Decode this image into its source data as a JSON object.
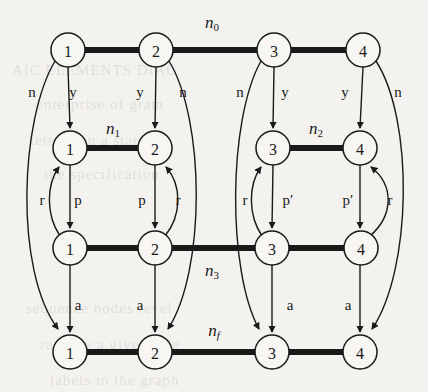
{
  "figure": {
    "background_color": "#f3f2ef",
    "ink_color": "#1a1a1a",
    "node_radius": 17,
    "thick_edge_width": 6,
    "thin_edge_width": 1.4
  },
  "ghost_text": [
    {
      "text": "AIC    ELEMENTS    DIAG",
      "x": 12,
      "y": 62
    },
    {
      "text": "enterprise  of  gram",
      "x": 36,
      "y": 96
    },
    {
      "text": "tetrated  n  a  state",
      "x": 30,
      "y": 132
    },
    {
      "text": "the  specification",
      "x": 44,
      "y": 166
    },
    {
      "text": "sequence  nodes  level",
      "x": 26,
      "y": 300
    },
    {
      "text": "rank  by  a  given  role",
      "x": 40,
      "y": 336
    },
    {
      "text": "labels  in  the  graph",
      "x": 50,
      "y": 372
    }
  ],
  "rows": [
    {
      "id": "row0",
      "name_label": "n_0",
      "name_base": "n",
      "name_sub": "0",
      "name_sub_italic": false,
      "label_x": 212,
      "label_y": 22,
      "y": 50,
      "nodes": [
        {
          "label": "1",
          "x": 68
        },
        {
          "label": "2",
          "x": 156
        },
        {
          "label": "3",
          "x": 274
        },
        {
          "label": "4",
          "x": 363
        }
      ]
    },
    {
      "id": "row1",
      "name_label": "n_1",
      "name_base": "n",
      "name_sub": "1",
      "name_sub_italic": false,
      "label_x": 113,
      "label_y": 128,
      "y": 148,
      "nodes": [
        {
          "label": "1",
          "x": 70
        },
        {
          "label": "2",
          "x": 155
        },
        {
          "label": "3",
          "x": 273
        },
        {
          "label": "4",
          "x": 360
        }
      ]
    },
    {
      "id": "row1b",
      "name_label": "n_2",
      "name_base": "n",
      "name_sub": "2",
      "name_sub_italic": false,
      "label_x": 316,
      "label_y": 128,
      "y": 148,
      "nodes": []
    },
    {
      "id": "row2",
      "name_label": "n_3",
      "name_base": "n",
      "name_sub": "3",
      "name_sub_italic": false,
      "label_x": 212,
      "label_y": 270,
      "y": 248,
      "nodes": [
        {
          "label": "1",
          "x": 70
        },
        {
          "label": "2",
          "x": 155
        },
        {
          "label": "3",
          "x": 272
        },
        {
          "label": "4",
          "x": 361
        }
      ]
    },
    {
      "id": "row3",
      "name_label": "n_f",
      "name_base": "n",
      "name_sub": "f",
      "name_sub_italic": true,
      "label_x": 214,
      "label_y": 330,
      "y": 352,
      "nodes": [
        {
          "label": "1",
          "x": 70
        },
        {
          "label": "2",
          "x": 155
        },
        {
          "label": "3",
          "x": 272
        },
        {
          "label": "4",
          "x": 360
        }
      ]
    }
  ],
  "edge_labels": [
    {
      "text": "n",
      "x": 32,
      "y": 92
    },
    {
      "text": "y",
      "x": 73,
      "y": 92
    },
    {
      "text": "y",
      "x": 140,
      "y": 92
    },
    {
      "text": "n",
      "x": 183,
      "y": 92
    },
    {
      "text": "n",
      "x": 240,
      "y": 92
    },
    {
      "text": "y",
      "x": 285,
      "y": 92
    },
    {
      "text": "y",
      "x": 345,
      "y": 92
    },
    {
      "text": "n",
      "x": 398,
      "y": 92
    },
    {
      "text": "r",
      "x": 42,
      "y": 200
    },
    {
      "text": "p",
      "x": 78,
      "y": 200
    },
    {
      "text": "p",
      "x": 142,
      "y": 200
    },
    {
      "text": "r",
      "x": 178,
      "y": 200
    },
    {
      "text": "r",
      "x": 245,
      "y": 200
    },
    {
      "text": "p′",
      "x": 288,
      "y": 200
    },
    {
      "text": "p′",
      "x": 348,
      "y": 200
    },
    {
      "text": "r",
      "x": 390,
      "y": 200
    },
    {
      "text": "a",
      "x": 78,
      "y": 305
    },
    {
      "text": "a",
      "x": 140,
      "y": 305
    },
    {
      "text": "a",
      "x": 290,
      "y": 305
    },
    {
      "text": "a",
      "x": 348,
      "y": 305
    }
  ],
  "thick_edges": [
    {
      "from": [
        68,
        50
      ],
      "to": [
        156,
        50
      ],
      "row": "n_0"
    },
    {
      "from": [
        156,
        50
      ],
      "to": [
        274,
        50
      ],
      "row": "n_0"
    },
    {
      "from": [
        274,
        50
      ],
      "to": [
        363,
        50
      ],
      "row": "n_0"
    },
    {
      "from": [
        70,
        148
      ],
      "to": [
        155,
        148
      ],
      "row": "n_1"
    },
    {
      "from": [
        273,
        148
      ],
      "to": [
        360,
        148
      ],
      "row": "n_2"
    },
    {
      "from": [
        70,
        248
      ],
      "to": [
        155,
        248
      ],
      "row": "n_3"
    },
    {
      "from": [
        155,
        248
      ],
      "to": [
        272,
        248
      ],
      "row": "n_3"
    },
    {
      "from": [
        272,
        248
      ],
      "to": [
        361,
        248
      ],
      "row": "n_3"
    },
    {
      "from": [
        70,
        352
      ],
      "to": [
        155,
        352
      ],
      "row": "n_f"
    },
    {
      "from": [
        155,
        352
      ],
      "to": [
        272,
        352
      ],
      "row": "n_f"
    },
    {
      "from": [
        272,
        352
      ],
      "to": [
        360,
        352
      ],
      "row": "n_f"
    }
  ]
}
